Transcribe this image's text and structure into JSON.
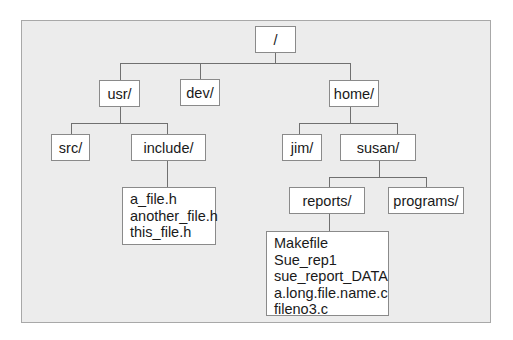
{
  "diagram": {
    "type": "directory-tree",
    "root": {
      "label": "/"
    },
    "level1": {
      "usr": {
        "label": "usr/"
      },
      "dev": {
        "label": "dev/"
      },
      "home": {
        "label": "home/"
      }
    },
    "usr_children": {
      "src": {
        "label": "src/"
      },
      "include": {
        "label": "include/"
      }
    },
    "include_files": [
      "a_file.h",
      "another_file.h",
      "this_file.h"
    ],
    "home_children": {
      "jim": {
        "label": "jim/"
      },
      "susan": {
        "label": "susan/"
      }
    },
    "susan_children": {
      "reports": {
        "label": "reports/"
      },
      "programs": {
        "label": "programs/"
      }
    },
    "reports_files": [
      "Makefile",
      "Sue_rep1",
      "sue_report_DATA",
      "a.long.file.name.c",
      "fileno3.c"
    ]
  }
}
